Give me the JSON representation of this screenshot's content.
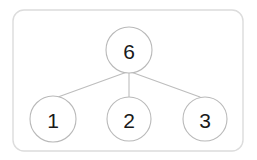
{
  "diagram": {
    "kind": "number-bond",
    "frame": {
      "x": 13,
      "y": 10,
      "width": 230,
      "height": 141,
      "radius": 11,
      "border_color": "#dcdcdc",
      "fill_color": "#ffffff"
    },
    "style": {
      "circle_stroke_color": "#b9b9b9",
      "connector_color": "#bdbdbd",
      "label_color": "#1a1a1a"
    },
    "whole": {
      "id": "whole",
      "label": "6",
      "cx": 129,
      "cy": 50,
      "r": 23
    },
    "parts": [
      {
        "id": "part-1",
        "label": "1",
        "cx": 53,
        "cy": 119,
        "r": 23
      },
      {
        "id": "part-2",
        "label": "2",
        "cx": 129,
        "cy": 119,
        "r": 22
      },
      {
        "id": "part-3",
        "label": "3",
        "cx": 205,
        "cy": 119,
        "r": 22
      }
    ],
    "connectors": [
      {
        "id": "connector-whole-to-part-1",
        "x1": 127,
        "y1": 72,
        "x2": 58,
        "y2": 97
      },
      {
        "id": "connector-whole-to-part-2",
        "x1": 129,
        "y1": 72,
        "x2": 129,
        "y2": 97
      },
      {
        "id": "connector-whole-to-part-3",
        "x1": 131,
        "y1": 72,
        "x2": 200,
        "y2": 97
      }
    ]
  }
}
